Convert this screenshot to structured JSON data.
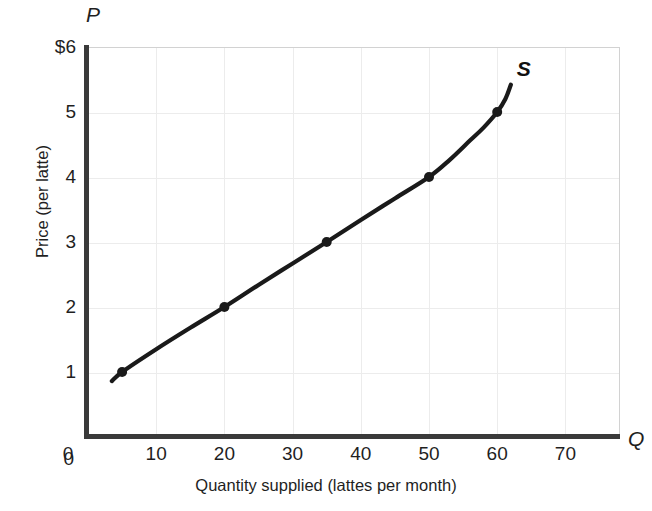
{
  "chart_data": {
    "type": "line",
    "title": "",
    "xlabel": "Quantity supplied (lattes per month)",
    "ylabel": "Price (per latte)",
    "x_axis_marker": "Q",
    "y_axis_marker": "P",
    "xlim": [
      0,
      78
    ],
    "ylim": [
      0,
      6
    ],
    "grid": true,
    "legend": "none",
    "x_ticks": [
      {
        "value": 0,
        "label": "0"
      },
      {
        "value": 10,
        "label": "10"
      },
      {
        "value": 20,
        "label": "20"
      },
      {
        "value": 30,
        "label": "30"
      },
      {
        "value": 40,
        "label": "40"
      },
      {
        "value": 50,
        "label": "50"
      },
      {
        "value": 60,
        "label": "60"
      },
      {
        "value": 70,
        "label": "70"
      }
    ],
    "y_ticks": [
      {
        "value": 0,
        "label": "0"
      },
      {
        "value": 1,
        "label": "1"
      },
      {
        "value": 2,
        "label": "2"
      },
      {
        "value": 3,
        "label": "3"
      },
      {
        "value": 4,
        "label": "4"
      },
      {
        "value": 5,
        "label": "5"
      },
      {
        "value": 6,
        "label": "$6"
      }
    ],
    "series": [
      {
        "name": "S",
        "annotation": "S",
        "color": "#1a1a1a",
        "marked_points": [
          {
            "x": 5,
            "y": 1
          },
          {
            "x": 20,
            "y": 2
          },
          {
            "x": 35,
            "y": 3
          },
          {
            "x": 50,
            "y": 4
          },
          {
            "x": 60,
            "y": 5
          }
        ],
        "curve_points": [
          {
            "x": 3.5,
            "y": 0.86
          },
          {
            "x": 5,
            "y": 1
          },
          {
            "x": 10,
            "y": 1.35
          },
          {
            "x": 15,
            "y": 1.68
          },
          {
            "x": 20,
            "y": 2
          },
          {
            "x": 25,
            "y": 2.34
          },
          {
            "x": 30,
            "y": 2.67
          },
          {
            "x": 35,
            "y": 3
          },
          {
            "x": 40,
            "y": 3.34
          },
          {
            "x": 45,
            "y": 3.67
          },
          {
            "x": 50,
            "y": 4
          },
          {
            "x": 53,
            "y": 4.26
          },
          {
            "x": 56,
            "y": 4.56
          },
          {
            "x": 58,
            "y": 4.76
          },
          {
            "x": 60,
            "y": 5
          },
          {
            "x": 61.2,
            "y": 5.2
          },
          {
            "x": 62,
            "y": 5.42
          }
        ]
      }
    ]
  },
  "geometry": {
    "origin_x_px": 88,
    "origin_y_px": 437,
    "px_per_x_unit": 6.82,
    "px_per_y_unit": 65
  }
}
